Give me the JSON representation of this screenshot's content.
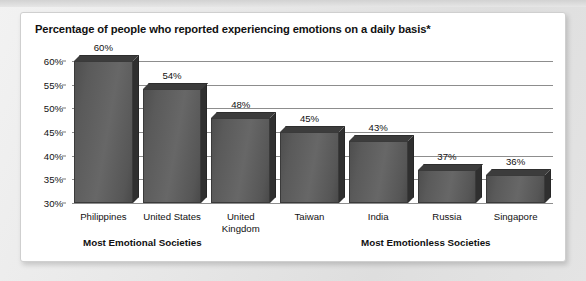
{
  "card": {
    "title": "Percentage of people who reported experiencing emotions on a daily basis*"
  },
  "footer": {
    "left_caption": "Most Emotional Societies",
    "right_caption": "Most Emotionless Societies"
  },
  "chart_data": {
    "type": "bar",
    "title": "Percentage of people who reported experiencing emotions on a daily basis*",
    "xlabel": "",
    "ylabel": "",
    "ylim": [
      30,
      60
    ],
    "ytick_labels": [
      "60%",
      "55%",
      "50%",
      "45%",
      "40%",
      "35%",
      "30%"
    ],
    "yticks": [
      60,
      55,
      50,
      45,
      40,
      35,
      30
    ],
    "grid": true,
    "legend": false,
    "categories": [
      "Philippines",
      "United States",
      "United Kingdom",
      "Taiwan",
      "India",
      "Russia",
      "Singapore"
    ],
    "values": [
      60,
      54,
      48,
      45,
      43,
      37,
      36
    ],
    "value_labels": [
      "60%",
      "54%",
      "48%",
      "45%",
      "43%",
      "37%",
      "36%"
    ],
    "bar_color": "#5a5a5a",
    "bar_top_color": "#3c3c3c",
    "bar_side_color": "#2f2f2f",
    "annotations": [
      "Most Emotional Societies",
      "Most Emotionless Societies"
    ]
  }
}
